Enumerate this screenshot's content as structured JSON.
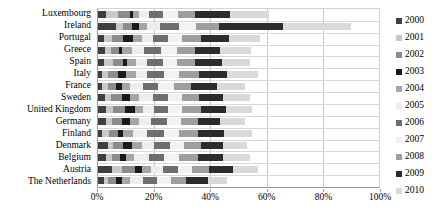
{
  "chart_data": {
    "type": "bar",
    "orientation": "horizontal",
    "stacked": true,
    "title": "",
    "subtitle": "",
    "xlabel": "",
    "ylabel": "",
    "xlim": [
      0,
      100
    ],
    "xtick_labels": [
      "0%",
      "20%",
      "40%",
      "60%",
      "80%",
      "100%"
    ],
    "xtick_values": [
      0,
      20,
      40,
      60,
      80,
      100
    ],
    "grid": true,
    "legend_position": "right",
    "categories": [
      "Luxembourg",
      "Ireland",
      "Portugal",
      "Greece",
      "Spain",
      "Italy",
      "France",
      "Sweden",
      "United Kingdom",
      "Germany",
      "Finland",
      "Denmark",
      "Belgium",
      "Austria",
      "The Netherlands"
    ],
    "series": [
      {
        "name": "2000",
        "color": "#3f3f3f",
        "values": [
          3.0,
          6.5,
          2.0,
          2.5,
          2.0,
          1.5,
          1.5,
          2.5,
          3.0,
          3.0,
          1.5,
          3.5,
          3.0,
          5.0,
          2.0
        ]
      },
      {
        "name": "2001",
        "color": "#c8c8c8",
        "values": [
          4.0,
          2.5,
          3.0,
          2.0,
          3.5,
          2.0,
          2.0,
          2.0,
          2.5,
          2.0,
          2.5,
          2.0,
          2.0,
          3.5,
          1.5
        ]
      },
      {
        "name": "2002",
        "color": "#8c8c8c",
        "values": [
          4.5,
          3.0,
          4.0,
          3.0,
          3.5,
          3.5,
          3.0,
          4.0,
          4.0,
          3.5,
          3.0,
          3.5,
          3.0,
          4.5,
          3.0
        ]
      },
      {
        "name": "2003",
        "color": "#1a1a1a",
        "values": [
          1.0,
          2.5,
          3.5,
          1.0,
          1.5,
          3.0,
          2.0,
          3.0,
          3.5,
          3.0,
          2.0,
          3.0,
          2.0,
          2.5,
          2.0
        ]
      },
      {
        "name": "2004",
        "color": "#a5a5a5",
        "values": [
          2.0,
          3.0,
          3.0,
          3.5,
          3.0,
          3.5,
          3.0,
          3.0,
          3.0,
          3.0,
          3.5,
          3.5,
          3.0,
          3.5,
          3.0
        ]
      },
      {
        "name": "2005",
        "color": "#ededed",
        "values": [
          3.5,
          4.5,
          4.0,
          4.5,
          4.0,
          4.0,
          4.5,
          5.0,
          4.0,
          4.5,
          5.0,
          4.5,
          5.0,
          4.0,
          4.5
        ]
      },
      {
        "name": "2006",
        "color": "#6e6e6e",
        "values": [
          5.0,
          7.0,
          5.5,
          6.0,
          5.5,
          6.0,
          5.5,
          5.5,
          5.0,
          5.5,
          6.0,
          5.5,
          5.5,
          5.5,
          5.0
        ]
      },
      {
        "name": "2007",
        "color": "#f2f2f2",
        "values": [
          5.5,
          6.0,
          5.0,
          5.5,
          5.0,
          5.5,
          5.5,
          5.0,
          5.0,
          5.0,
          5.5,
          5.0,
          5.5,
          5.0,
          5.0
        ]
      },
      {
        "name": "2008",
        "color": "#9e9e9e",
        "values": [
          6.0,
          8.0,
          6.5,
          6.5,
          6.5,
          7.0,
          6.0,
          6.0,
          6.5,
          6.0,
          6.5,
          6.0,
          6.5,
          6.0,
          5.5
        ]
      },
      {
        "name": "2009",
        "color": "#2b2b2b",
        "values": [
          12.5,
          23.0,
          10.0,
          9.0,
          9.5,
          10.0,
          9.5,
          8.5,
          9.0,
          8.0,
          9.5,
          8.0,
          9.0,
          8.5,
          7.5
        ]
      },
      {
        "name": "2010",
        "color": "#d9d9d9",
        "values": [
          14.0,
          24.0,
          11.0,
          11.0,
          10.0,
          11.0,
          10.0,
          9.5,
          9.5,
          9.0,
          10.0,
          8.5,
          9.5,
          9.0,
          7.0
        ]
      }
    ],
    "totals": [
      61.0,
      90.0,
      57.5,
      54.5,
      54.0,
      57.0,
      52.5,
      54.0,
      55.0,
      52.5,
      55.0,
      53.0,
      54.0,
      57.0,
      46.0
    ]
  }
}
